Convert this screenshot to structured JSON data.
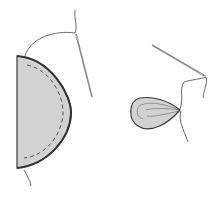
{
  "diagram": {
    "type": "illustration",
    "colors": {
      "background": "#ffffff",
      "fabric_fill": "#d2d2d2",
      "outline": "#3a3a3a",
      "stitch": "#555555",
      "thread": "#444444",
      "needle": "#8a8a8a"
    },
    "figures": [
      {
        "id": "half-circle-fabric",
        "description": "Semicircle of fabric with a dashed running stitch along the curved edge; thread leads up to a needle"
      },
      {
        "id": "gathered-fabric",
        "description": "Fabric pulled into a gathered teardrop shape with thread tails and needle"
      }
    ]
  }
}
